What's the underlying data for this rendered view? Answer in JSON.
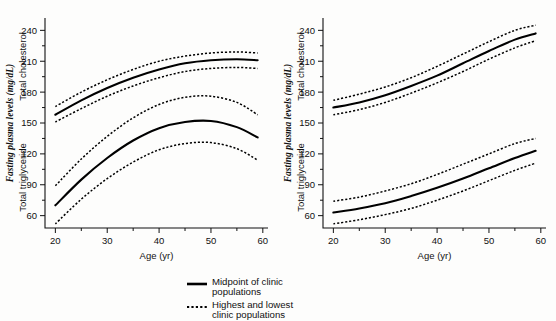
{
  "figure": {
    "background": "#fdfdfc",
    "ink": "#000000"
  },
  "legend": {
    "items": [
      {
        "key": "solid-line",
        "style": "solid",
        "line1": "Midpoint of clinic",
        "line2": "populations"
      },
      {
        "key": "dotted-line",
        "style": "dotted",
        "line1": "Highest and lowest",
        "line2": "clinic populations"
      }
    ]
  },
  "chart_data": [
    {
      "type": "line",
      "panel": "left",
      "title": "",
      "xlabel": "Age (yr)",
      "ylabel_italic": "Fasting plasma levels (mg/dL)",
      "ylabel_upper": "Total cholesterol",
      "ylabel_lower": "Total triglyceride",
      "xlim": [
        18,
        61
      ],
      "ylim": [
        48,
        252
      ],
      "xticks": [
        20,
        30,
        40,
        50,
        60
      ],
      "xticklabels": [
        "20",
        "30",
        "40",
        "50",
        "60"
      ],
      "xminorticks": [
        25,
        35,
        45,
        55
      ],
      "yticks": [
        60,
        90,
        120,
        150,
        180,
        210,
        240
      ],
      "yticklabels": [
        "60",
        "90",
        "120",
        "150",
        "180",
        "210",
        "240"
      ],
      "yminorticks": [
        75,
        105,
        135,
        165,
        195,
        225
      ],
      "grid": false,
      "legend_position": "below-figure-center",
      "x": [
        20,
        25,
        30,
        35,
        40,
        45,
        50,
        55,
        59
      ],
      "series": [
        {
          "name": "Total cholesterol - midpoint of clinic populations",
          "style": "solid",
          "values": [
            158,
            172,
            184,
            194,
            202,
            208,
            211,
            212,
            211
          ]
        },
        {
          "name": "Total cholesterol - highest clinic populations",
          "style": "dotted",
          "values": [
            166,
            180,
            192,
            202,
            210,
            215,
            218,
            219,
            218
          ]
        },
        {
          "name": "Total cholesterol - lowest clinic populations",
          "style": "dotted",
          "values": [
            151,
            164,
            176,
            186,
            194,
            200,
            203,
            204,
            203
          ]
        },
        {
          "name": "Total triglyceride - midpoint of clinic populations",
          "style": "solid",
          "values": [
            70,
            95,
            116,
            133,
            145,
            151,
            152,
            146,
            136
          ]
        },
        {
          "name": "Total triglyceride - highest clinic populations",
          "style": "dotted",
          "values": [
            89,
            115,
            137,
            155,
            168,
            175,
            176,
            170,
            158
          ]
        },
        {
          "name": "Total triglyceride - lowest clinic populations",
          "style": "dotted",
          "values": [
            52,
            76,
            96,
            112,
            124,
            130,
            131,
            125,
            114
          ]
        }
      ]
    },
    {
      "type": "line",
      "panel": "right",
      "title": "",
      "xlabel": "Age (yr)",
      "ylabel_italic": "Fasting plasma levels (mg/dL)",
      "ylabel_upper": "Total cholesterol",
      "ylabel_lower": "Total triglyceride",
      "xlim": [
        18,
        61
      ],
      "ylim": [
        48,
        252
      ],
      "xticks": [
        20,
        30,
        40,
        50,
        60
      ],
      "xticklabels": [
        "20",
        "30",
        "40",
        "50",
        "60"
      ],
      "xminorticks": [
        25,
        35,
        45,
        55
      ],
      "yticks": [
        60,
        90,
        120,
        150,
        180,
        210,
        240
      ],
      "yticklabels": [
        "60",
        "90",
        "120",
        "150",
        "180",
        "210",
        "240"
      ],
      "yminorticks": [
        75,
        105,
        135,
        165,
        195,
        225
      ],
      "grid": false,
      "legend_position": "below-figure-center",
      "x": [
        20,
        25,
        30,
        35,
        40,
        45,
        50,
        55,
        59
      ],
      "series": [
        {
          "name": "Total cholesterol - midpoint of clinic populations",
          "style": "solid",
          "values": [
            165,
            170,
            177,
            186,
            196,
            208,
            220,
            231,
            237
          ]
        },
        {
          "name": "Total cholesterol - highest clinic populations",
          "style": "dotted",
          "values": [
            172,
            178,
            185,
            194,
            205,
            217,
            229,
            240,
            245
          ]
        },
        {
          "name": "Total cholesterol - lowest clinic populations",
          "style": "dotted",
          "values": [
            158,
            163,
            170,
            179,
            189,
            200,
            212,
            223,
            230
          ]
        },
        {
          "name": "Total triglyceride - midpoint of clinic populations",
          "style": "solid",
          "values": [
            63,
            67,
            72,
            79,
            87,
            96,
            106,
            116,
            123
          ]
        },
        {
          "name": "Total triglyceride - highest clinic populations",
          "style": "dotted",
          "values": [
            74,
            78,
            84,
            91,
            100,
            110,
            120,
            130,
            135
          ]
        },
        {
          "name": "Total triglyceride - lowest clinic populations",
          "style": "dotted",
          "values": [
            52,
            56,
            61,
            67,
            75,
            84,
            94,
            104,
            111
          ]
        }
      ]
    }
  ]
}
